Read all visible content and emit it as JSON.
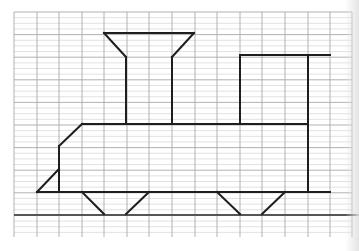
{
  "worksheet": {
    "type": "grid-drawing",
    "subject": "steam locomotive outline on graph paper",
    "colors": {
      "paper": "#ffffff",
      "major_grid": "#a9a9a9",
      "minor_grid": "#d4d4d4",
      "drawing": "#1e1e1e",
      "rail": "#555555"
    },
    "grid": {
      "x_lines": [
        14,
        37,
        59,
        82,
        104,
        127,
        149,
        172,
        195,
        217,
        240,
        262,
        285,
        308,
        330,
        352
      ],
      "major_y_start": 12,
      "major_y_step": 22.6,
      "major_y_count": 16,
      "minor_per_cell": 4,
      "y_end": 237
    },
    "drawing": {
      "segments": [
        {
          "part": "chimney-top",
          "x1": 104,
          "y1": 33,
          "x2": 194,
          "y2": 33
        },
        {
          "part": "chimney-left-flare",
          "x1": 104,
          "y1": 33,
          "x2": 126,
          "y2": 57
        },
        {
          "part": "chimney-right-flare",
          "x1": 194,
          "y1": 33,
          "x2": 172,
          "y2": 57
        },
        {
          "part": "chimney-left-stem",
          "x1": 126,
          "y1": 57,
          "x2": 126,
          "y2": 124
        },
        {
          "part": "chimney-right-stem",
          "x1": 172,
          "y1": 57,
          "x2": 172,
          "y2": 124
        },
        {
          "part": "boiler-top",
          "x1": 82,
          "y1": 124,
          "x2": 308,
          "y2": 124
        },
        {
          "part": "front-slant",
          "x1": 82,
          "y1": 124,
          "x2": 59,
          "y2": 146
        },
        {
          "part": "front-vertical",
          "x1": 59,
          "y1": 146,
          "x2": 59,
          "y2": 192
        },
        {
          "part": "cowcatcher",
          "x1": 37,
          "y1": 192,
          "x2": 59,
          "y2": 169
        },
        {
          "part": "cab-left",
          "x1": 240,
          "y1": 55,
          "x2": 240,
          "y2": 124
        },
        {
          "part": "cab-roof",
          "x1": 240,
          "y1": 55,
          "x2": 330,
          "y2": 55
        },
        {
          "part": "cab-back",
          "x1": 308,
          "y1": 55,
          "x2": 308,
          "y2": 192
        },
        {
          "part": "chassis",
          "x1": 37,
          "y1": 192,
          "x2": 330,
          "y2": 192
        },
        {
          "part": "wheel-1-left",
          "x1": 82,
          "y1": 192,
          "x2": 104,
          "y2": 214
        },
        {
          "part": "wheel-1-right",
          "x1": 149,
          "y1": 192,
          "x2": 126,
          "y2": 214
        },
        {
          "part": "wheel-2-left",
          "x1": 217,
          "y1": 192,
          "x2": 240,
          "y2": 214
        },
        {
          "part": "wheel-2-right",
          "x1": 285,
          "y1": 192,
          "x2": 262,
          "y2": 214
        }
      ],
      "rail": {
        "x1": 14,
        "y1": 215,
        "x2": 359,
        "y2": 215
      }
    }
  }
}
